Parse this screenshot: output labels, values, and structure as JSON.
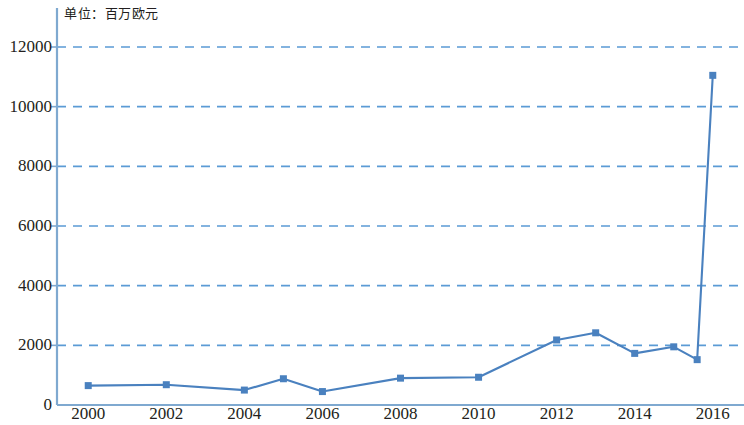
{
  "chart_data": {
    "type": "line",
    "title": "",
    "annotation": "单位：百万欧元",
    "xlabel": "",
    "ylabel": "",
    "ylim": [
      0,
      12000
    ],
    "xlim": [
      1999.2,
      2016.8
    ],
    "grid": true,
    "legend": "none",
    "series_color": "#4a81bf",
    "grid_color": "#5b9bd5",
    "axis_color": "#7fa9d0",
    "yticks": [
      0,
      2000,
      4000,
      6000,
      8000,
      10000,
      12000
    ],
    "ytick_labels": [
      "0",
      "2000",
      "4000",
      "6000",
      "8000",
      "10000",
      "12000"
    ],
    "xticks": [
      2000,
      2002,
      2004,
      2006,
      2008,
      2010,
      2012,
      2014,
      2016
    ],
    "xtick_labels": [
      "2000",
      "2002",
      "2004",
      "2006",
      "2008",
      "2010",
      "2012",
      "2014",
      "2016"
    ],
    "x": [
      2000,
      2002,
      2004,
      2005,
      2006,
      2008,
      2010,
      2012,
      2013,
      2014,
      2015,
      2015.6,
      2016
    ],
    "values": [
      650,
      680,
      500,
      880,
      450,
      900,
      930,
      2180,
      2420,
      1730,
      1950,
      1520,
      11050
    ],
    "points": [
      {
        "x": 2000,
        "y": 650
      },
      {
        "x": 2002,
        "y": 680
      },
      {
        "x": 2004,
        "y": 500
      },
      {
        "x": 2005,
        "y": 880
      },
      {
        "x": 2006,
        "y": 450
      },
      {
        "x": 2008,
        "y": 900
      },
      {
        "x": 2010,
        "y": 930
      },
      {
        "x": 2012,
        "y": 2180
      },
      {
        "x": 2013,
        "y": 2420
      },
      {
        "x": 2014,
        "y": 1730
      },
      {
        "x": 2015,
        "y": 1950
      },
      {
        "x": 2015.6,
        "y": 1520
      },
      {
        "x": 2016,
        "y": 11050
      }
    ]
  }
}
